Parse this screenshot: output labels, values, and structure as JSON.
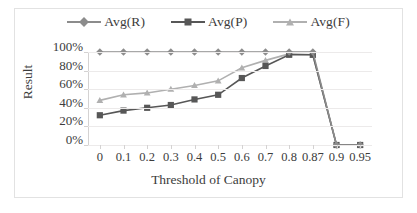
{
  "chart_data": {
    "type": "line",
    "title": "",
    "xlabel": "Threshold of Canopy",
    "ylabel": "Result",
    "categories": [
      "0",
      "0.1",
      "0.2",
      "0.3",
      "0.4",
      "0.5",
      "0.6",
      "0.7",
      "0.8",
      "0.87",
      "0.9",
      "0.95"
    ],
    "ytick_labels": [
      "0%",
      "20%",
      "40%",
      "60%",
      "80%",
      "100%"
    ],
    "ytick_values": [
      0,
      20,
      40,
      60,
      80,
      100
    ],
    "ylim": [
      0,
      100
    ],
    "grid": true,
    "legend_position": "top-center",
    "series": [
      {
        "name": "Avg(R)",
        "marker": "diamond",
        "color": "#8c8c8c",
        "values": [
          100,
          100,
          100,
          100,
          100,
          100,
          100,
          100,
          100,
          100,
          0,
          0
        ]
      },
      {
        "name": "Avg(P)",
        "marker": "square",
        "color": "#575757",
        "values": [
          32,
          37,
          40,
          43,
          49,
          54,
          72,
          85,
          97,
          97,
          0,
          0
        ]
      },
      {
        "name": "Avg(F)",
        "marker": "triangle",
        "color": "#b0b0b0",
        "values": [
          48,
          54,
          56,
          60,
          64,
          69,
          83,
          91,
          98,
          97,
          0,
          0
        ]
      }
    ]
  },
  "legend": {
    "items": [
      {
        "label": "Avg(R)"
      },
      {
        "label": "Avg(P)"
      },
      {
        "label": "Avg(F)"
      }
    ]
  },
  "axes": {
    "y_title": "Result",
    "x_title": "Threshold of Canopy"
  }
}
